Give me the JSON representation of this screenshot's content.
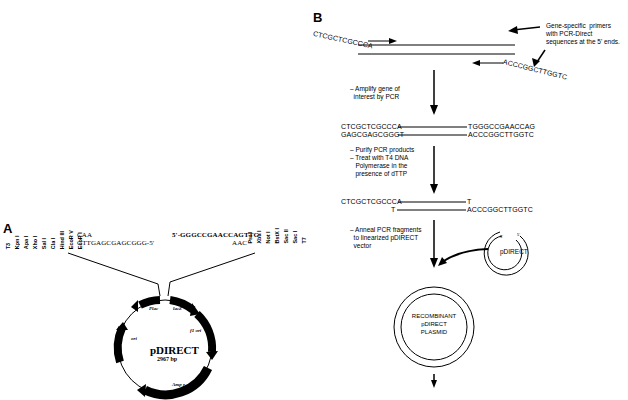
{
  "panel_a": {
    "label": "A",
    "left_sites": [
      "T3",
      "Kpn I",
      "Apa I",
      "Xho I",
      "Sal I",
      "Cla I",
      "Hind III",
      "EcoR V",
      "EcoR I"
    ],
    "left_seq_top": "CAA",
    "left_seq_bottom": "GTTGAGCGAGCGGG-5'",
    "right_seq_top": "5'-GGGCCGAACCAGTTG",
    "right_seq_bottom": "AAC",
    "right_sites": [
      "Pst I",
      "Xba I",
      "Not I",
      "BstX I",
      "Sac II",
      "Sac I",
      "T7"
    ],
    "plasmid": {
      "name": "pDIRECT",
      "size": "2967 bp",
      "features": [
        "Plac",
        "lacZ",
        "f1 ori",
        "Amp r",
        "ori"
      ]
    }
  },
  "panel_b": {
    "label": "B",
    "primer_fwd": "CTCGCTCGCCCA",
    "primer_rev": "ACCCGGCTTGGTC",
    "primer_note": "Gene-specific  primers\nwith PCR-Direct\nsequences at the 5' ends.",
    "step1": "– Amplify gene of\n  interest by PCR",
    "pcr_top_left": "CTCGCTCGCCCA",
    "pcr_top_right": "TGGGCCGAACCAG",
    "pcr_bot_left": "GAGCGAGCGGGT",
    "pcr_bot_right": "ACCCGGCTTGGTC",
    "step2": "– Purify PCR products\n– Treat with T4 DNA\n   Polymerase in the\n   presence of dTTP",
    "t4_top_left": "CTCGCTCGCCCA",
    "t4_top_right": "T",
    "t4_bot_left": "T",
    "t4_bot_right": "ACCCGGCTTGGTC",
    "step3": "– Anneal PCR fragments\n  to linearized pDIRECT\n  vector",
    "vector_label": "pDIRECT",
    "vector_end_5a": "5'",
    "vector_end_5b": "5'",
    "recombinant": [
      "RECOMBINANT",
      "pDIRECT",
      "PLASMID"
    ]
  }
}
